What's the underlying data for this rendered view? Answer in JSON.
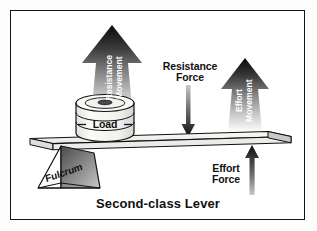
{
  "diagram": {
    "title": "Second-class Lever",
    "background_color": "#ffffff",
    "frame_color": "#151515",
    "labels": {
      "resistance_movement": "Resistance\nMovement",
      "resistance_force": "Resistance\nForce",
      "effort_movement": "Effort\nMovement",
      "effort_force": "Effort\nForce",
      "load": "Load",
      "fulcrum": "Fulcrum"
    },
    "parts": [
      {
        "name": "lever-beam",
        "label": "",
        "fill": "#f0f0ee",
        "stroke": "#111111"
      },
      {
        "name": "fulcrum-prism",
        "label": "Fulcrum",
        "fill": "#8d8d8d",
        "stroke": "#111111"
      },
      {
        "name": "load-spool",
        "label": "Load",
        "fill": "#f2f2f0",
        "stroke": "#111111"
      },
      {
        "name": "resistance-movement-arrow",
        "label": "Resistance Movement",
        "fill": "#0a0a0a",
        "direction": "up"
      },
      {
        "name": "effort-movement-arrow",
        "label": "Effort Movement",
        "fill": "#0a0a0a",
        "direction": "up"
      },
      {
        "name": "resistance-force-arrow",
        "label": "Resistance Force",
        "fill": "#2b2b2b",
        "direction": "down"
      },
      {
        "name": "effort-force-arrow",
        "label": "Effort Force",
        "fill": "#1a1a1a",
        "direction": "up"
      }
    ]
  }
}
